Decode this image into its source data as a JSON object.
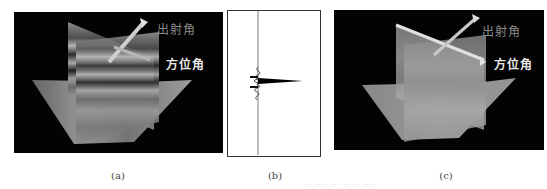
{
  "figure": {
    "panels": [
      {
        "id": "a",
        "caption": "(a)",
        "type": "3d-volume-cross-section",
        "labels": {
          "exit_angle": "出射角",
          "azimuth_angle": "方位角"
        },
        "texture": "high-contrast layered"
      },
      {
        "id": "b",
        "caption": "(b)",
        "type": "wavelet-trace"
      },
      {
        "id": "c",
        "caption": "(c)",
        "type": "3d-volume-cross-section",
        "labels": {
          "exit_angle": "出射角",
          "azimuth_angle": "方位角"
        },
        "texture": "smooth low-contrast"
      }
    ],
    "footer_faint_text": "·· ···· ··· ·· ·· ····"
  },
  "colors": {
    "background": "#ffffff",
    "volume_bg": "#030303",
    "exit_label": "#8a8a8a",
    "azimuth_label": "#e8e8e8",
    "trace": "#000000"
  }
}
